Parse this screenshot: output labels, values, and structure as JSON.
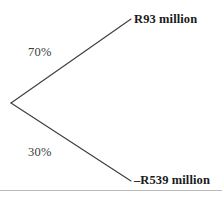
{
  "figure": {
    "type": "decision-tree",
    "background_color": "#ffffff",
    "width": 222,
    "height": 198
  },
  "tree": {
    "root": {
      "x": 11,
      "y": 103
    },
    "line_color": "#3c3c3c",
    "line_width": 1.1,
    "branches": [
      {
        "id": "upper",
        "probability_label": "70%",
        "outcome_label": "R93 million",
        "endpoint": {
          "x": 131,
          "y": 19
        }
      },
      {
        "id": "lower",
        "probability_label": "30%",
        "outcome_label": "–R539 million",
        "endpoint": {
          "x": 131,
          "y": 181
        }
      }
    ]
  },
  "footer": {
    "rule_color": "#b9b9b9"
  },
  "chart_data": {
    "type": "diagram",
    "title": "",
    "categories": [
      "R93 million",
      "–R539 million"
    ],
    "values": [
      70,
      30
    ],
    "probability_labels": [
      "70%",
      "30%"
    ],
    "outcome_labels": [
      "R93 million",
      "–R539 million"
    ],
    "xlabel": "",
    "ylabel": ""
  }
}
